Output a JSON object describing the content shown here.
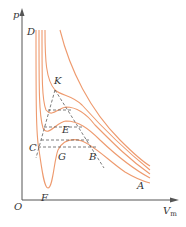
{
  "diagram": {
    "title": "",
    "axes": {
      "y_label": "p",
      "x_label": "V",
      "x_label_sub": "m",
      "origin_label": "O"
    },
    "points": {
      "D": "D",
      "K": "K",
      "E": "E",
      "C": "C",
      "G": "G",
      "B": "B",
      "F": "F",
      "A": "A"
    },
    "colors": {
      "isotherm": "#ee9a6e",
      "dashed": "#5a5a5a",
      "axis": "#555555"
    }
  }
}
